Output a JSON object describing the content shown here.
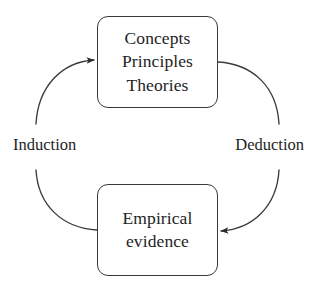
{
  "diagram": {
    "background_color": "#ffffff",
    "stroke_color": "#3b3b3b",
    "text_color": "#1e1e1e",
    "nodes": [
      {
        "id": "theory",
        "name": "concepts-principles-theories",
        "lines": [
          "Concepts",
          "Principles",
          "Theories"
        ],
        "shape": "rounded-rectangle"
      },
      {
        "id": "evidence",
        "name": "empirical-evidence",
        "lines": [
          "Empirical",
          "evidence"
        ],
        "shape": "rounded-rectangle"
      }
    ],
    "edges": [
      {
        "id": "induction",
        "label": "Induction",
        "from": "evidence",
        "to": "theory",
        "side": "left",
        "arrowhead": "end",
        "direction": "upward"
      },
      {
        "id": "deduction",
        "label": "Deduction",
        "from": "theory",
        "to": "evidence",
        "side": "right",
        "arrowhead": "end",
        "direction": "downward"
      }
    ]
  }
}
